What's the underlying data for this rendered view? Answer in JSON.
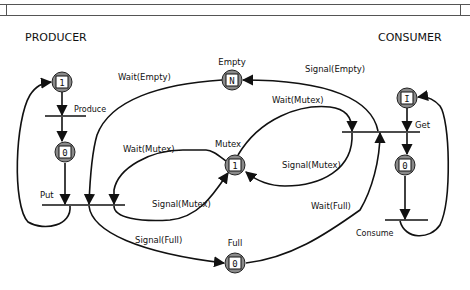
{
  "header": {
    "title_bar": ""
  },
  "sections": {
    "producer": "PRODUCER",
    "consumer": "CONSUMER"
  },
  "places": {
    "producer_ready": {
      "label": "",
      "tokens": "1"
    },
    "producer_produced": {
      "label": "",
      "tokens": "0"
    },
    "empty": {
      "label": "Empty",
      "tokens": "N"
    },
    "mutex": {
      "label": "Mutex",
      "tokens": "1"
    },
    "full": {
      "label": "Full",
      "tokens": "0"
    },
    "consumer_ready": {
      "label": "",
      "tokens": "I"
    },
    "consumer_got": {
      "label": "",
      "tokens": "0"
    }
  },
  "transitions": {
    "produce": "Produce",
    "put": "Put",
    "get": "Get",
    "consume": "Consume"
  },
  "arc_labels": {
    "wait_empty": "Wait(Empty)",
    "signal_empty": "Signal(Empty)",
    "wait_mutex_producer": "Wait(Mutex)",
    "signal_mutex_producer": "Signal(Mutex)",
    "wait_mutex_consumer": "Wait(Mutex)",
    "signal_mutex_consumer": "Signal(Mutex)",
    "signal_full": "Signal(Full)",
    "wait_full": "Wait(Full)"
  },
  "colors": {
    "ink": "#111111",
    "node_fill": "#8a8a8a",
    "background": "#ffffff"
  }
}
